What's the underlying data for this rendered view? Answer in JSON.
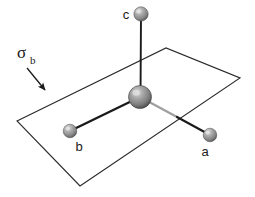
{
  "figure": {
    "background_color": "#ffffff",
    "width": 255,
    "height": 197,
    "plane": {
      "label_symbol": "σ",
      "label_subscript": "b",
      "label_full": "σb",
      "stroke_color": "#2b2b2b",
      "fill": "none",
      "vertices": [
        {
          "x": 17,
          "y": 121
        },
        {
          "x": 166,
          "y": 48
        },
        {
          "x": 240,
          "y": 78
        },
        {
          "x": 80,
          "y": 186
        }
      ],
      "annotation_arrow": {
        "from": {
          "x": 27,
          "y": 68
        },
        "to": {
          "x": 47,
          "y": 92
        },
        "color": "#1a1a1a"
      },
      "label_position": {
        "x": 17,
        "y": 58
      }
    },
    "center_atom": {
      "name": "central-atom",
      "x": 140,
      "y": 97,
      "radius": 11.5,
      "color": "#8c8c8c",
      "highlight_color": "#d2d2d2",
      "shadow_color": "#4a4a4a"
    },
    "atoms": [
      {
        "id": "c",
        "label": "c",
        "x": 141,
        "y": 14,
        "radius": 7.2,
        "color": "#9a9a9a",
        "highlight_color": "#dcdcdc",
        "shadow_color": "#585858",
        "label_x": 126,
        "label_y": 18,
        "bond_color": "#1a1a1a",
        "bond_width": 1.9,
        "bond_behind": false
      },
      {
        "id": "b",
        "label": "b",
        "x": 70,
        "y": 131,
        "radius": 6.8,
        "color": "#9a9a9a",
        "highlight_color": "#dcdcdc",
        "shadow_color": "#585858",
        "label_x": 77,
        "label_y": 150,
        "bond_color": "#1a1a1a",
        "bond_width": 2.4,
        "bond_behind": false
      },
      {
        "id": "a",
        "label": "a",
        "x": 210,
        "y": 135,
        "radius": 6.8,
        "color": "#9a9a9a",
        "highlight_color": "#dcdcdc",
        "shadow_color": "#585858",
        "label_x": 202,
        "label_y": 155,
        "bond_color": "#1a1a1a",
        "bond_behind_color": "#9e9e9e",
        "bond_width": 2.2,
        "bond_behind": true,
        "bond_crossing_point": {
          "x": 177,
          "y": 117
        }
      }
    ]
  }
}
